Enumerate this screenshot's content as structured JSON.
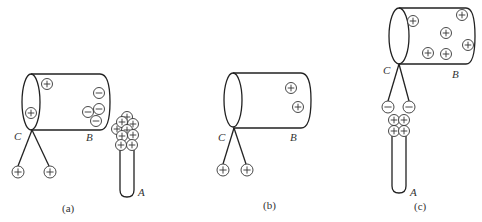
{
  "panels": [
    {
      "id": "a",
      "caption": "(a)",
      "labels": {
        "C": "C",
        "B": "B",
        "A": "A"
      },
      "cylinder_charges": [
        {
          "sign": "+",
          "x": 47,
          "y": 84
        },
        {
          "sign": "+",
          "x": 31,
          "y": 113
        },
        {
          "sign": "-",
          "x": 99,
          "y": 93
        },
        {
          "sign": "-",
          "x": 99,
          "y": 109
        },
        {
          "sign": "-",
          "x": 88,
          "y": 112
        },
        {
          "sign": "-",
          "x": 96,
          "y": 121
        }
      ],
      "pendulum_charges": [
        {
          "sign": "+",
          "x": 18,
          "y": 172
        },
        {
          "sign": "+",
          "x": 50,
          "y": 172
        }
      ],
      "rod_charges": [
        {
          "sign": "+",
          "x": 127,
          "y": 117
        },
        {
          "sign": "+",
          "x": 133,
          "y": 124
        },
        {
          "sign": "+",
          "x": 117,
          "y": 129
        },
        {
          "sign": "+",
          "x": 122,
          "y": 122
        },
        {
          "sign": "+",
          "x": 127,
          "y": 130
        },
        {
          "sign": "+",
          "x": 133,
          "y": 135
        },
        {
          "sign": "+",
          "x": 122,
          "y": 136
        },
        {
          "sign": "+",
          "x": 121,
          "y": 145
        },
        {
          "sign": "+",
          "x": 132,
          "y": 145
        }
      ]
    },
    {
      "id": "b",
      "caption": "(b)",
      "labels": {
        "C": "C",
        "B": "B"
      },
      "cylinder_charges": [
        {
          "sign": "+",
          "x": 291,
          "y": 88
        },
        {
          "sign": "+",
          "x": 298,
          "y": 107
        }
      ],
      "pendulum_charges": [
        {
          "sign": "+",
          "x": 223,
          "y": 170
        },
        {
          "sign": "+",
          "x": 247,
          "y": 170
        }
      ]
    },
    {
      "id": "c",
      "caption": "(c)",
      "labels": {
        "C": "C",
        "B": "B",
        "A": "A"
      },
      "cylinder_charges": [
        {
          "sign": "+",
          "x": 413,
          "y": 21
        },
        {
          "sign": "+",
          "x": 462,
          "y": 15
        },
        {
          "sign": "+",
          "x": 446,
          "y": 33
        },
        {
          "sign": "+",
          "x": 468,
          "y": 45
        },
        {
          "sign": "+",
          "x": 428,
          "y": 53
        },
        {
          "sign": "+",
          "x": 446,
          "y": 54
        }
      ],
      "pendulum_charges": [
        {
          "sign": "-",
          "x": 388,
          "y": 107
        },
        {
          "sign": "-",
          "x": 409,
          "y": 107
        }
      ],
      "rod_charges": [
        {
          "sign": "+",
          "x": 394,
          "y": 120
        },
        {
          "sign": "+",
          "x": 404,
          "y": 120
        },
        {
          "sign": "+",
          "x": 394,
          "y": 131
        },
        {
          "sign": "+",
          "x": 404,
          "y": 131
        }
      ]
    }
  ]
}
